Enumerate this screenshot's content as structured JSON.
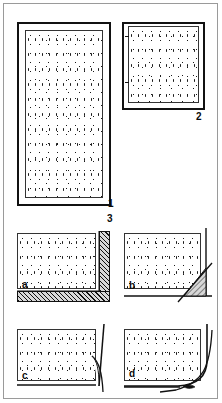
{
  "figure": {
    "background_color": "#ffffff",
    "ink_color": "#111111",
    "hatch_fill_color": "#d8d8d8",
    "border_color": "#9a9a9a"
  },
  "panels": [
    {
      "id": "panel-1",
      "label": "1",
      "shape": "tall-rectangle",
      "fill": "stipple",
      "description": "Tall upright rectangular panel with double frame and stippled core"
    },
    {
      "id": "panel-2",
      "label": "2",
      "shape": "square",
      "fill": "stipple",
      "description": "Square panel with frame and stippled core"
    }
  ],
  "section": {
    "label": "3",
    "description": "Corner joint detail variants"
  },
  "details": [
    {
      "id": "detail-a",
      "label": "a",
      "corner_type": "square-hatched-return",
      "description": "Stippled face with hatched L-shaped corner return"
    },
    {
      "id": "detail-b",
      "label": "b",
      "corner_type": "mitred-hatched-triangle",
      "description": "Stippled face with hatched triangular corner fill and diagonal cut line"
    },
    {
      "id": "detail-c",
      "label": "c",
      "corner_type": "thin-sliver",
      "description": "Stippled face with thin slender corner sliver"
    },
    {
      "id": "detail-d",
      "label": "d",
      "corner_type": "curved-fillet",
      "description": "Stippled face with curved filleted corner"
    }
  ]
}
